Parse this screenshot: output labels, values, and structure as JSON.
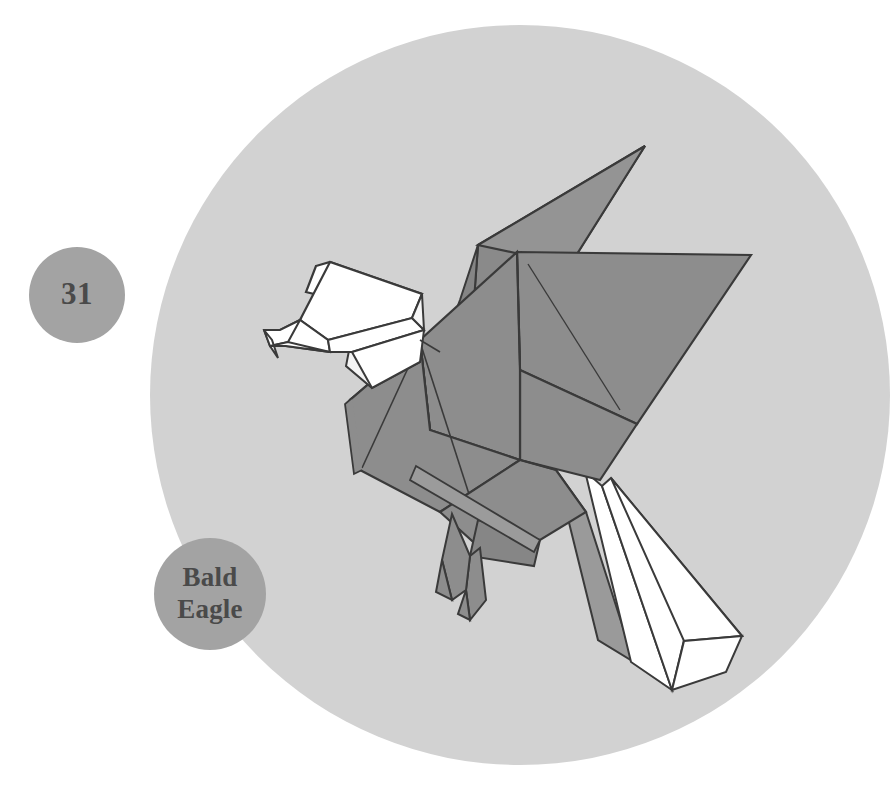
{
  "illustration": {
    "title": "Bald Eagle",
    "model_number": "31",
    "subject": "origami bald eagle",
    "canvas": {
      "width": 896,
      "height": 791,
      "background": "#ffffff"
    }
  },
  "backdrop": {
    "shape": "circle",
    "cx": 520,
    "cy": 395,
    "r": 370,
    "color": "#d2d2d2"
  },
  "badges": [
    {
      "id": "number-badge",
      "label": "31",
      "cx": 77,
      "cy": 295,
      "r": 48,
      "fill": "#a3a3a3",
      "text_color": "#4a4a4a"
    },
    {
      "id": "name-badge",
      "label_line1": "Bald",
      "label_line2": "Eagle",
      "cx": 210,
      "cy": 594,
      "r": 56,
      "fill": "#a3a3a3",
      "text_color": "#4a4a4a"
    }
  ],
  "palette": {
    "paper_gray": "#8d8d8d",
    "paper_gray_dark": "#7a7a7a",
    "paper_gray_mid": "#868686",
    "paper_gray_light": "#9a9a9a",
    "paper_white": "#ffffff",
    "paper_offwhite": "#f2f2f2",
    "outline": "#3a3a3a",
    "backdrop": "#d2d2d2",
    "badge": "#a3a3a3",
    "text": "#4a4a4a"
  },
  "figure": {
    "parts": [
      {
        "name": "upper-wing",
        "tone": "paper_gray_dark"
      },
      {
        "name": "far-wing-tip",
        "tone": "paper_white"
      },
      {
        "name": "main-wing",
        "tone": "paper_gray"
      },
      {
        "name": "wing-underside",
        "tone": "paper_gray_mid"
      },
      {
        "name": "head",
        "tone": "paper_white"
      },
      {
        "name": "beak",
        "tone": "paper_white"
      },
      {
        "name": "neck",
        "tone": "paper_offwhite"
      },
      {
        "name": "breast",
        "tone": "paper_gray"
      },
      {
        "name": "body",
        "tone": "paper_gray"
      },
      {
        "name": "legs",
        "tone": "paper_gray_mid"
      },
      {
        "name": "talons",
        "tone": "paper_gray_mid"
      },
      {
        "name": "tail",
        "tone": "paper_white"
      },
      {
        "name": "tail-underfold",
        "tone": "paper_offwhite"
      }
    ]
  }
}
